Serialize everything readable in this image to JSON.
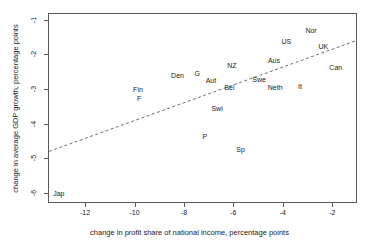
{
  "chart_data": {
    "type": "scatter",
    "title": "",
    "xlabel": "change in profit share of national income, percentage points",
    "ylabel": "change in average GDP growth, percentage points",
    "xlim": [
      -13.5,
      -1.0
    ],
    "ylim": [
      -6.3,
      -0.8
    ],
    "xticks": [
      -12,
      -10,
      -8,
      -6,
      -4,
      -2
    ],
    "xticklabels": [
      "-12",
      "-10",
      "-8",
      "-6",
      "-4",
      "-2"
    ],
    "yticks": [
      -1,
      -2,
      -3,
      -4,
      -5,
      -6
    ],
    "yticklabels": [
      "-1",
      "-2",
      "-3",
      "-4",
      "-5",
      "-6"
    ],
    "grid": false,
    "legend": null,
    "marker_style": "text-label",
    "points": [
      {
        "label": "Nor",
        "x": -2.9,
        "y": -1.3
      },
      {
        "label": "US",
        "x": -3.9,
        "y": -1.6
      },
      {
        "label": "UK",
        "x": -2.4,
        "y": -1.75
      },
      {
        "label": "Can",
        "x": -1.9,
        "y": -2.35
      },
      {
        "label": "Aus",
        "x": -4.4,
        "y": -2.15
      },
      {
        "label": "NZ",
        "x": -6.1,
        "y": -2.3
      },
      {
        "label": "G",
        "x": -7.5,
        "y": -2.55
      },
      {
        "label": "Den",
        "x": -8.3,
        "y": -2.6
      },
      {
        "label": "Aut",
        "x": -6.95,
        "y": -2.75
      },
      {
        "label": "Swe",
        "x": -5.0,
        "y": -2.7
      },
      {
        "label": "Bel",
        "x": -6.2,
        "y": -2.95
      },
      {
        "label": "Neth",
        "x": -4.35,
        "y": -2.95
      },
      {
        "label": "It",
        "x": -3.35,
        "y": -2.9
      },
      {
        "label": "Fin",
        "x": -9.9,
        "y": -3.0
      },
      {
        "label": "F",
        "x": -9.85,
        "y": -3.25
      },
      {
        "label": "Swi",
        "x": -6.7,
        "y": -3.55
      },
      {
        "label": "P",
        "x": -7.2,
        "y": -4.35
      },
      {
        "label": "Sp",
        "x": -5.75,
        "y": -4.75
      },
      {
        "label": "Jap",
        "x": -13.1,
        "y": -6.0
      }
    ],
    "trendline": {
      "style": "dashed",
      "x_start": -13.5,
      "y_start": -4.82,
      "x_end": -1.0,
      "y_end": -1.58
    },
    "colors": {
      "frame": "#5a5a5a",
      "text": "#1a1a1a",
      "trendline": "#6b6b6b",
      "background": "#ffffff"
    }
  }
}
